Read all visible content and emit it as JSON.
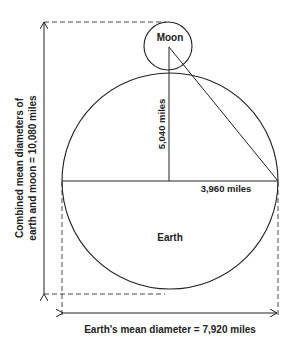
{
  "diagram": {
    "bodies": {
      "moon_label": "Moon",
      "earth_label": "Earth"
    },
    "measurements": {
      "moon_center_to_earth_center": "5,040 miles",
      "earth_radius": "3,960 miles",
      "earth_diameter": "Earth's mean diameter = 7,920 miles",
      "combined_line1": "Combined mean diameters of",
      "combined_line2": "earth and moon = 10,080 miles"
    },
    "colors": {
      "stroke": "#222222",
      "background": "#ffffff"
    }
  }
}
